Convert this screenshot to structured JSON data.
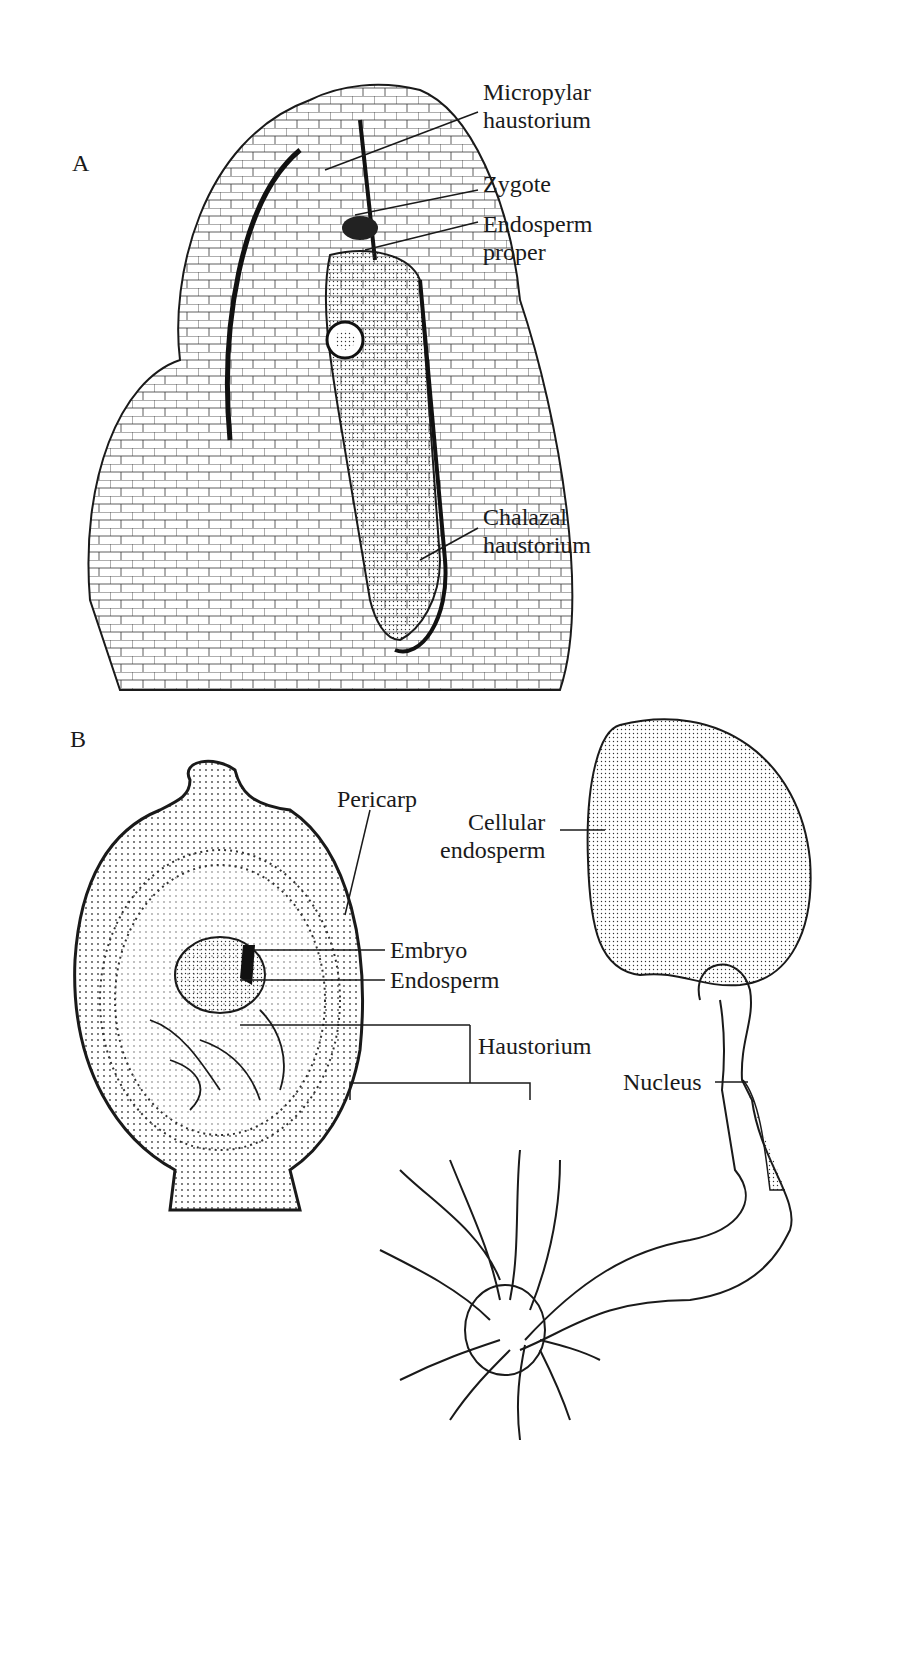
{
  "figure": {
    "panels": [
      {
        "id": "A",
        "label": "A",
        "annotations": [
          {
            "line1": "Micropylar",
            "line2": "haustorium"
          },
          {
            "line1": "Zygote",
            "line2": ""
          },
          {
            "line1": "Endosperm",
            "line2": "proper"
          },
          {
            "line1": "Chalazal",
            "line2": "haustorium"
          }
        ]
      },
      {
        "id": "B",
        "label": "B",
        "annotations": [
          {
            "line1": "Pericarp",
            "line2": ""
          },
          {
            "line1": "Embryo",
            "line2": ""
          },
          {
            "line1": "Endosperm",
            "line2": ""
          },
          {
            "line1": "Haustorium",
            "line2": ""
          },
          {
            "line1": "Cellular",
            "line2": "endosperm"
          },
          {
            "line1": "Nucleus",
            "line2": ""
          }
        ]
      }
    ],
    "colors": {
      "ink": "#1a1a1a",
      "background": "#ffffff",
      "stipple": "#d8d8d8"
    }
  }
}
